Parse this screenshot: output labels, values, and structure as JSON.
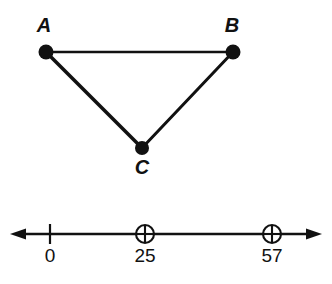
{
  "figure": {
    "background_color": "#ffffff",
    "ink_color": "#111111",
    "width": 332,
    "height": 284
  },
  "triangle": {
    "name": "triangle-abc",
    "vertices": [
      {
        "id": "A",
        "label": "A",
        "x": 46,
        "y": 52,
        "label_x": 44,
        "label_y": 32,
        "dot_radius": 7.5
      },
      {
        "id": "B",
        "label": "B",
        "x": 233,
        "y": 52,
        "label_x": 232,
        "label_y": 32,
        "dot_radius": 7.5
      },
      {
        "id": "C",
        "label": "C",
        "x": 142,
        "y": 148,
        "label_x": 142,
        "label_y": 174,
        "dot_radius": 7.0
      }
    ],
    "edges": [
      {
        "id": "AB",
        "from": "A",
        "to": "B",
        "x1": 46,
        "y1": 52,
        "x2": 233,
        "y2": 52,
        "width": 2.6
      },
      {
        "id": "AC",
        "from": "A",
        "to": "C",
        "x1": 46,
        "y1": 52,
        "x2": 142,
        "y2": 148,
        "width": 3.6
      },
      {
        "id": "BC",
        "from": "B",
        "to": "C",
        "x1": 233,
        "y1": 52,
        "x2": 142,
        "y2": 148,
        "width": 3.0
      }
    ]
  },
  "number_line": {
    "name": "number-line",
    "y": 234,
    "x_start": 12,
    "x_end": 320,
    "left_arrow": true,
    "right_arrow": true,
    "ticks": [
      {
        "value": "0",
        "x": 50,
        "style": "tick",
        "label_y": 262
      },
      {
        "value": "25",
        "x": 145,
        "style": "circle",
        "label_y": 262,
        "radius": 9
      },
      {
        "value": "57",
        "x": 272,
        "style": "circle",
        "label_y": 262,
        "radius": 9
      }
    ]
  }
}
